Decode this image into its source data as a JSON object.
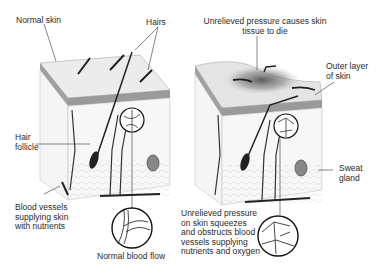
{
  "diagram": {
    "panels": [
      {
        "id": "normal",
        "labels": {
          "normal_skin": "Normal skin",
          "hairs": "Hairs",
          "hair_follicle": "Hair\nfollicle",
          "blood_vessels": "Blood vessels\nsupplying skin\nwith nutrients",
          "normal_blood_flow": "Normal blood flow"
        }
      },
      {
        "id": "pressure",
        "labels": {
          "pressure_title": "Unrelieved pressure causes skin\ntissue to die",
          "outer_layer": "Outer layer\nof skin",
          "sweat_gland": "Sweat\ngland",
          "obstructed": "Unrelieved pressure\non skin squeezes\nand obstructs blood\nvessels supplying\nnutrients and oxygen"
        }
      }
    ],
    "colors": {
      "skin_surface": "#e8e8e8",
      "epidermis": "#9a9a9a",
      "dermis": "#f4f4f4",
      "ink": "#222222",
      "bruise": "#555555"
    }
  }
}
